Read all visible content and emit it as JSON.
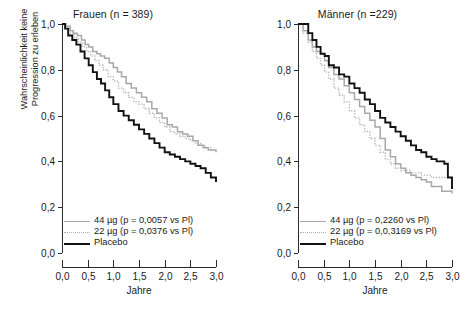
{
  "figure": {
    "yaxis_label": "Wahrscheinlichkeit keine\nProgression zu erleben",
    "xaxis_label": "Jahre",
    "y_ticks": [
      "0,0",
      "0,2",
      "0,4",
      "0,6",
      "0,8",
      "1,0"
    ],
    "x_ticks": [
      "0,0",
      "0,5",
      "1,0",
      "1,5",
      "2,0",
      "2,5",
      "3,0"
    ],
    "colors": {
      "placebo": "#121212",
      "dose44": "#a8a8a8",
      "dose22": "#b4b4b4",
      "axis": "#2b2b2b",
      "background": "#ffffff"
    }
  },
  "panels": [
    {
      "title": "Frauen (n = 389)",
      "legend": [
        {
          "label": "44 µg (p = 0,0057 vs Pl)",
          "style": "solid-gray"
        },
        {
          "label": "22 µg (p = 0,0376 vs Pl)",
          "style": "dotted-gray"
        },
        {
          "label": "Placebo",
          "style": "solid-black"
        }
      ]
    },
    {
      "title": "Männer (n =229)",
      "legend": [
        {
          "label": "44 µg (p = 0,2260 vs Pl)",
          "style": "solid-gray"
        },
        {
          "label": "22 µg (p = 0,0,3169 vs Pl)",
          "style": "dotted-gray"
        },
        {
          "label": "Placebo",
          "style": "solid-black"
        }
      ]
    }
  ],
  "chart_data": [
    {
      "type": "line",
      "title": "Frauen (n = 389)",
      "xlabel": "Jahre",
      "ylabel": "Wahrscheinlichkeit keine Progression zu erleben",
      "xlim": [
        0,
        3
      ],
      "ylim": [
        0,
        1
      ],
      "grid": false,
      "legend_position": "lower-left",
      "series": [
        {
          "name": "44 µg (p = 0,0057 vs Pl)",
          "style": "solid-gray",
          "x": [
            0.0,
            0.08,
            0.16,
            0.22,
            0.3,
            0.38,
            0.45,
            0.52,
            0.6,
            0.68,
            0.75,
            0.83,
            0.92,
            1.0,
            1.08,
            1.16,
            1.25,
            1.35,
            1.45,
            1.55,
            1.65,
            1.75,
            1.85,
            1.95,
            2.05,
            2.15,
            2.25,
            2.35,
            2.45,
            2.55,
            2.65,
            2.75,
            2.85,
            3.0
          ],
          "y": [
            1.0,
            0.99,
            0.97,
            0.96,
            0.95,
            0.93,
            0.91,
            0.9,
            0.88,
            0.87,
            0.86,
            0.85,
            0.83,
            0.81,
            0.79,
            0.77,
            0.74,
            0.72,
            0.7,
            0.68,
            0.66,
            0.63,
            0.61,
            0.59,
            0.56,
            0.55,
            0.53,
            0.52,
            0.51,
            0.49,
            0.47,
            0.46,
            0.45,
            0.44
          ]
        },
        {
          "name": "22 µg (p = 0,0376 vs Pl)",
          "style": "dotted-gray",
          "x": [
            0.0,
            0.08,
            0.16,
            0.24,
            0.32,
            0.4,
            0.48,
            0.56,
            0.64,
            0.72,
            0.8,
            0.9,
            1.0,
            1.1,
            1.2,
            1.3,
            1.4,
            1.5,
            1.6,
            1.7,
            1.8,
            1.9,
            2.0,
            2.1,
            2.2,
            2.3,
            2.4,
            2.5,
            2.6,
            2.7,
            2.8,
            2.9,
            3.0
          ],
          "y": [
            1.0,
            0.98,
            0.96,
            0.94,
            0.92,
            0.9,
            0.88,
            0.86,
            0.84,
            0.82,
            0.8,
            0.77,
            0.75,
            0.72,
            0.7,
            0.68,
            0.66,
            0.65,
            0.63,
            0.61,
            0.59,
            0.57,
            0.55,
            0.53,
            0.52,
            0.51,
            0.5,
            0.49,
            0.48,
            0.47,
            0.46,
            0.45,
            0.45
          ]
        },
        {
          "name": "Placebo",
          "style": "solid-black",
          "x": [
            0.0,
            0.06,
            0.12,
            0.2,
            0.28,
            0.36,
            0.44,
            0.52,
            0.6,
            0.68,
            0.76,
            0.84,
            0.92,
            1.0,
            1.1,
            1.2,
            1.3,
            1.4,
            1.5,
            1.6,
            1.7,
            1.8,
            1.9,
            2.0,
            2.1,
            2.2,
            2.3,
            2.4,
            2.5,
            2.6,
            2.7,
            2.8,
            2.9,
            3.0
          ],
          "y": [
            1.0,
            0.98,
            0.95,
            0.93,
            0.91,
            0.88,
            0.85,
            0.82,
            0.79,
            0.76,
            0.74,
            0.71,
            0.68,
            0.65,
            0.62,
            0.6,
            0.58,
            0.56,
            0.54,
            0.52,
            0.5,
            0.48,
            0.46,
            0.44,
            0.43,
            0.42,
            0.41,
            0.4,
            0.39,
            0.38,
            0.37,
            0.35,
            0.33,
            0.31
          ]
        }
      ]
    },
    {
      "type": "line",
      "title": "Männer (n =229)",
      "xlabel": "Jahre",
      "ylabel": "Wahrscheinlichkeit keine Progression zu erleben",
      "xlim": [
        0,
        3
      ],
      "ylim": [
        0,
        1
      ],
      "grid": false,
      "legend_position": "lower-left",
      "series": [
        {
          "name": "44 µg (p = 0,2260 vs Pl)",
          "style": "solid-gray",
          "x": [
            0.0,
            0.1,
            0.2,
            0.28,
            0.36,
            0.44,
            0.52,
            0.6,
            0.7,
            0.8,
            0.9,
            1.0,
            1.1,
            1.2,
            1.3,
            1.4,
            1.5,
            1.6,
            1.7,
            1.8,
            1.9,
            2.0,
            2.1,
            2.2,
            2.3,
            2.4,
            2.5,
            2.6,
            2.8,
            3.0
          ],
          "y": [
            1.0,
            0.97,
            0.93,
            0.9,
            0.88,
            0.87,
            0.84,
            0.81,
            0.78,
            0.76,
            0.73,
            0.7,
            0.67,
            0.64,
            0.61,
            0.58,
            0.55,
            0.5,
            0.45,
            0.42,
            0.39,
            0.37,
            0.35,
            0.34,
            0.33,
            0.32,
            0.31,
            0.29,
            0.27,
            0.26
          ]
        },
        {
          "name": "22 µg (p = 0,0,3169 vs Pl)",
          "style": "dotted-gray",
          "x": [
            0.0,
            0.1,
            0.2,
            0.28,
            0.36,
            0.44,
            0.52,
            0.6,
            0.7,
            0.8,
            0.9,
            1.0,
            1.1,
            1.2,
            1.3,
            1.4,
            1.5,
            1.6,
            1.7,
            1.8,
            1.9,
            2.0,
            2.2,
            2.4,
            2.6,
            2.8,
            3.0
          ],
          "y": [
            1.0,
            0.96,
            0.92,
            0.88,
            0.85,
            0.82,
            0.79,
            0.76,
            0.72,
            0.69,
            0.66,
            0.62,
            0.59,
            0.56,
            0.53,
            0.5,
            0.47,
            0.44,
            0.41,
            0.39,
            0.37,
            0.36,
            0.35,
            0.34,
            0.33,
            0.33,
            0.32
          ]
        },
        {
          "name": "Placebo",
          "style": "solid-black",
          "x": [
            0.0,
            0.12,
            0.2,
            0.28,
            0.36,
            0.44,
            0.52,
            0.6,
            0.7,
            0.8,
            0.9,
            1.0,
            1.1,
            1.2,
            1.3,
            1.4,
            1.5,
            1.6,
            1.7,
            1.8,
            1.9,
            2.0,
            2.1,
            2.2,
            2.3,
            2.4,
            2.5,
            2.6,
            2.7,
            2.85,
            2.92,
            3.0
          ],
          "y": [
            1.0,
            1.0,
            0.96,
            0.93,
            0.9,
            0.87,
            0.86,
            0.82,
            0.81,
            0.78,
            0.77,
            0.74,
            0.72,
            0.7,
            0.67,
            0.65,
            0.62,
            0.59,
            0.57,
            0.55,
            0.53,
            0.51,
            0.49,
            0.47,
            0.45,
            0.44,
            0.42,
            0.41,
            0.4,
            0.39,
            0.33,
            0.28
          ]
        }
      ]
    }
  ]
}
